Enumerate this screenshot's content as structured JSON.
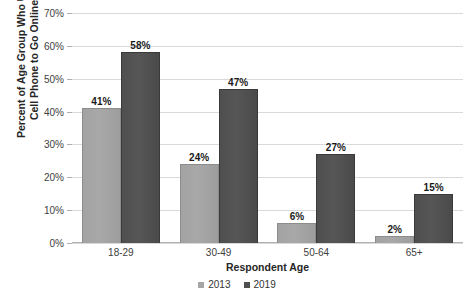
{
  "chart_data": {
    "type": "bar",
    "title": "",
    "xlabel": "Respondent Age",
    "ylabel_line1": "Percent of Age Group Who Use",
    "ylabel_line2": "Cell Phone to Go Online",
    "categories": [
      "18-29",
      "30-49",
      "50-64",
      "65+"
    ],
    "series": [
      {
        "name": "2013",
        "color": "#a6a6a6",
        "values": [
          41,
          24,
          6,
          2
        ],
        "labels": [
          "41%",
          "24%",
          "6%",
          "2%"
        ]
      },
      {
        "name": "2019",
        "color": "#4f4f4f",
        "values": [
          58,
          47,
          27,
          15
        ],
        "labels": [
          "58%",
          "47%",
          "27%",
          "15%"
        ]
      }
    ],
    "ylim": [
      0,
      70
    ],
    "ytick_values": [
      0,
      10,
      20,
      30,
      40,
      50,
      60,
      70
    ],
    "ytick_labels": [
      "0%",
      "10%",
      "20%",
      "30%",
      "40%",
      "50%",
      "60%",
      "70%"
    ],
    "grid": true,
    "legend_position": "bottom"
  }
}
